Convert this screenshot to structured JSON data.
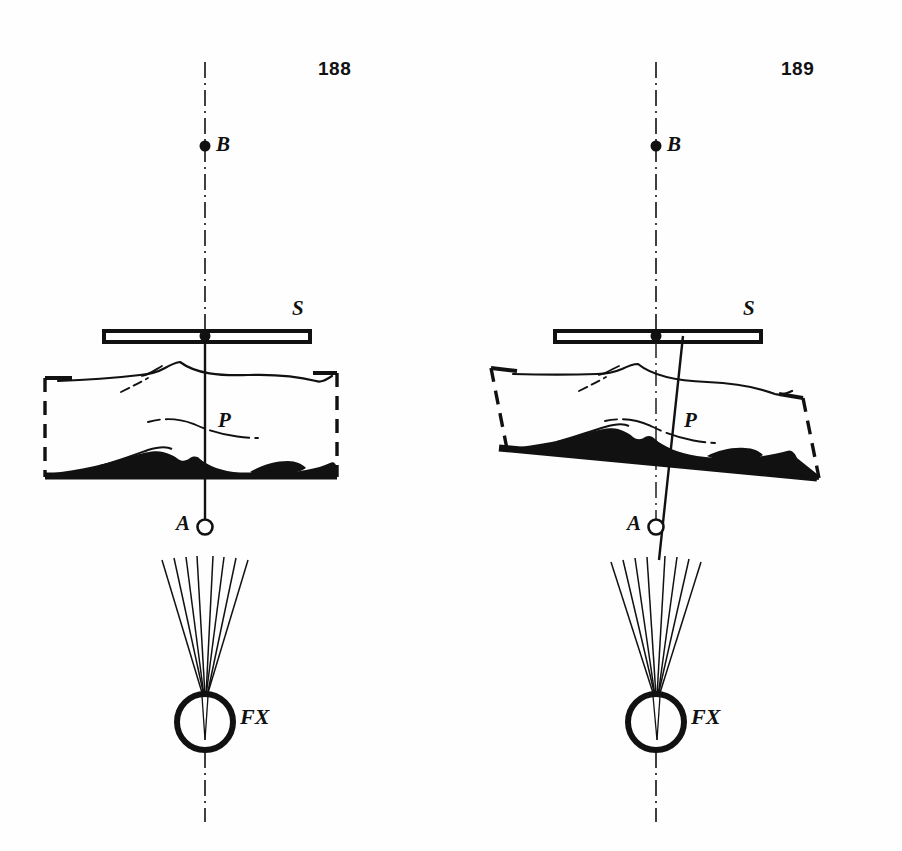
{
  "page": {
    "background": "#ffffff",
    "ink": "#111111",
    "width": 902,
    "height": 851,
    "kind": "radiographic-geometry-diagram-pair"
  },
  "figures": [
    {
      "id": "fig-188",
      "number": "188",
      "number_pos": {
        "x": 330,
        "y": 68
      },
      "caption_role": "central-ray-perpendicular-to-table",
      "axis": {
        "name": "central-ray-axis",
        "style": "dash-dot",
        "x": 205,
        "y_top": 62,
        "y_bottom": 822,
        "tilted": false
      },
      "points": [
        {
          "name": "B",
          "label": "B",
          "type": "filled-dot",
          "x": 205,
          "y": 146,
          "label_x": 216,
          "label_y": 134
        },
        {
          "name": "S",
          "label": "S",
          "type": "film-cassette",
          "x": 205,
          "y": 336,
          "label_x": 291,
          "label_y": 300
        },
        {
          "name": "P",
          "label": "P",
          "type": "filled-dot",
          "x": 205,
          "y": 424,
          "label_x": 216,
          "label_y": 410
        },
        {
          "name": "A",
          "label": "A",
          "type": "open-circle",
          "x": 205,
          "y": 527,
          "label_x": 176,
          "label_y": 513
        },
        {
          "name": "FX",
          "label": "FX",
          "type": "focus-circle",
          "x": 205,
          "y": 722,
          "label_x": 240,
          "label_y": 708
        }
      ],
      "cassette": {
        "x1": 104,
        "x2": 310,
        "y": 331,
        "height": 11
      },
      "ray_line": {
        "x_top": 205,
        "y_top": 336,
        "x_bottom": 205,
        "y_bottom": 527
      },
      "body": {
        "bracket_left_x": 45,
        "bracket_right_x": 337,
        "bracket_top_y": 376,
        "bracket_bottom_y": 477,
        "table_y": 477,
        "tilt_deg": 0
      },
      "beam_fan": {
        "apex_x": 205,
        "apex_y": 696,
        "spread_x": 44,
        "y_start": 558,
        "ray_count": 8
      },
      "focus_circle": {
        "cx": 205,
        "cy": 722,
        "r": 28,
        "stroke": 6
      }
    },
    {
      "id": "fig-189",
      "number": "189",
      "number_pos": {
        "x": 781,
        "y": 68
      },
      "caption_role": "table-tilted-central-ray-oblique",
      "axis": {
        "name": "central-ray-axis",
        "style": "dash-dot",
        "x": 205,
        "y_top": 62,
        "y_bottom": 822,
        "tilted": false
      },
      "points": [
        {
          "name": "B",
          "label": "B",
          "type": "filled-dot",
          "x": 205,
          "y": 146,
          "label_x": 216,
          "label_y": 134
        },
        {
          "name": "S",
          "label": "S",
          "type": "film-cassette",
          "x": 205,
          "y": 336,
          "label_x": 291,
          "label_y": 300
        },
        {
          "name": "P",
          "label": "P",
          "type": "filled-dot",
          "x": 220,
          "y": 424,
          "label_x": 231,
          "label_y": 410
        },
        {
          "name": "A",
          "label": "A",
          "type": "open-circle",
          "x": 205,
          "y": 527,
          "label_x": 176,
          "label_y": 513
        },
        {
          "name": "FX",
          "label": "FX",
          "type": "focus-circle",
          "x": 205,
          "y": 722,
          "label_x": 240,
          "label_y": 708
        }
      ],
      "cassette": {
        "x1": 104,
        "x2": 310,
        "y": 331,
        "height": 11
      },
      "ray_line": {
        "x_top": 232,
        "y_top": 336,
        "x_bottom": 208,
        "y_bottom": 560
      },
      "body": {
        "bracket_left_x": 40,
        "bracket_right_x": 352,
        "bracket_top_y": 368,
        "bracket_bottom_y": 462,
        "table_y": 462,
        "tilt_deg": 11
      },
      "beam_fan": {
        "apex_x": 207,
        "apex_y": 696,
        "spread_x": 44,
        "y_start": 558,
        "ray_count": 8
      },
      "focus_circle": {
        "cx": 205,
        "cy": 722,
        "r": 28,
        "stroke": 6
      }
    }
  ],
  "legend": {
    "B": "reference point above cassette on central axis",
    "S": "film / cassette plane",
    "P": "point of interest inside patient",
    "A": "tabletop reference point / beam aperture",
    "FX": "X-ray tube focus"
  }
}
